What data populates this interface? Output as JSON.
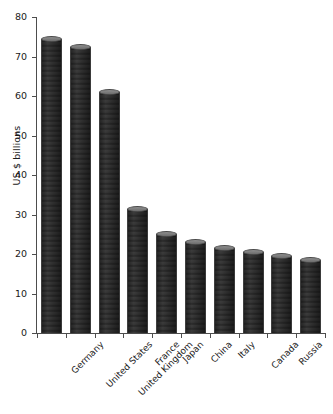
{
  "chart_data": {
    "type": "bar",
    "title": "",
    "xlabel": "",
    "ylabel": "US $ billions",
    "ylim": [
      0,
      80
    ],
    "yticks": [
      0,
      10,
      20,
      30,
      40,
      50,
      60,
      70,
      80
    ],
    "ytick_labels": [
      "0",
      "10",
      "20",
      "30",
      "40",
      "50",
      "60",
      "70",
      "80"
    ],
    "grid": false,
    "legend": null,
    "bar_color": "#5e5e5e",
    "categories": [
      "Germany",
      "United States",
      "United Kingdom",
      "France",
      "Japan",
      "China",
      "Italy",
      "Canada",
      "Russia",
      "Korea, Republic of"
    ],
    "values": [
      74.5,
      72.5,
      61,
      31.5,
      25,
      23,
      21.5,
      20.5,
      19.5,
      18.5
    ]
  }
}
